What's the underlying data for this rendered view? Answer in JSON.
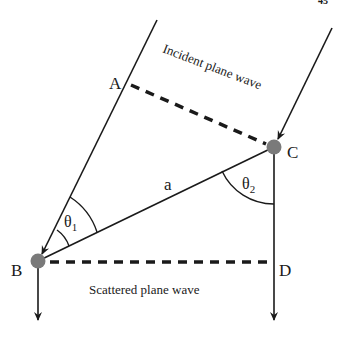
{
  "page_number_fragment": "45",
  "labels": {
    "point_a": "A",
    "point_b": "B",
    "point_c": "C",
    "point_d": "D",
    "segment_a": "a",
    "theta": "θ",
    "theta1_sub": "1",
    "theta2_sub": "2"
  },
  "captions": {
    "incident": "Incident plane wave",
    "scattered": "Scattered plane wave"
  },
  "colors": {
    "line": "#1a1a1a",
    "scatterer": "#7a7a7a",
    "background": "#ffffff"
  },
  "geometry": {
    "A": [
      125,
      83
    ],
    "B": [
      38,
      261
    ],
    "C": [
      274,
      147
    ],
    "D": [
      274,
      262
    ]
  }
}
